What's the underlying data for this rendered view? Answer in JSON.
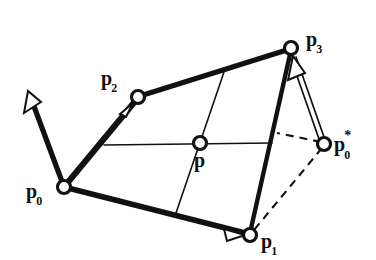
{
  "figure": {
    "background_color": "#ffffff",
    "ink_color": "#111111",
    "width": 376,
    "height": 260,
    "labels": {
      "p0": {
        "base": "p",
        "sub": "0",
        "sup": ""
      },
      "p1": {
        "base": "p",
        "sub": "1",
        "sup": ""
      },
      "p2": {
        "base": "p",
        "sub": "2",
        "sup": ""
      },
      "p3": {
        "base": "p",
        "sub": "3",
        "sup": ""
      },
      "p": {
        "base": "p",
        "sub": "",
        "sup": ""
      },
      "p0s": {
        "base": "p",
        "sub": "0",
        "sup": "*"
      }
    },
    "nodes": [
      {
        "name": "p0",
        "x": 64,
        "y": 187,
        "r": 6.5
      },
      {
        "name": "p1",
        "x": 250,
        "y": 235,
        "r": 6.5
      },
      {
        "name": "p2",
        "x": 138,
        "y": 97,
        "r": 6.5
      },
      {
        "name": "p3",
        "x": 291,
        "y": 48,
        "r": 6.5
      },
      {
        "name": "p",
        "x": 200,
        "y": 143,
        "r": 6.5
      },
      {
        "name": "p0s",
        "x": 324,
        "y": 144,
        "r": 6.5
      }
    ],
    "thick_edges": [
      {
        "name": "edge-p0-p2",
        "x1": 64,
        "y1": 187,
        "x2": 138,
        "y2": 97
      },
      {
        "name": "edge-p2-p3",
        "x1": 138,
        "y1": 97,
        "x2": 291,
        "y2": 48
      },
      {
        "name": "edge-p0-p1",
        "x1": 64,
        "y1": 187,
        "x2": 250,
        "y2": 235
      },
      {
        "name": "edge-p3-p1",
        "x1": 291,
        "y1": 48,
        "x2": 250,
        "y2": 235
      },
      {
        "name": "edge-p0-tangent",
        "x1": 64,
        "y1": 187,
        "x2": 30,
        "y2": 96
      }
    ],
    "thin_edges": [
      {
        "name": "grid-horizontal",
        "x1": 104,
        "y1": 145,
        "x2": 272,
        "y2": 143
      },
      {
        "name": "grid-vertical",
        "x1": 224,
        "y1": 72,
        "x2": 176,
        "y2": 213
      }
    ],
    "dashed_edges": [
      {
        "name": "dashed-p0s-upper",
        "x1": 324,
        "y1": 144,
        "x2": 277,
        "y2": 133
      },
      {
        "name": "dashed-p0s-p1",
        "x1": 324,
        "y1": 144,
        "x2": 253,
        "y2": 231
      }
    ],
    "double_arrow": {
      "name": "reflection-arrow-p0s-p3",
      "x1": 322,
      "y1": 140,
      "x2": 293,
      "y2": 57
    },
    "arrowheads": [
      {
        "name": "arrowhead-tangent-p0",
        "x": 30,
        "y": 96,
        "angle": -110,
        "style": "hollow"
      },
      {
        "name": "arrowhead-p0-p2",
        "x": 130,
        "y": 107,
        "angle": -50,
        "style": "hollow"
      },
      {
        "name": "arrowhead-p0-p1",
        "x": 241,
        "y": 233,
        "angle": 15,
        "style": "hollow"
      },
      {
        "name": "arrowhead-p0s-p3",
        "x": 293,
        "y": 57,
        "angle": -109,
        "style": "hollow"
      }
    ]
  }
}
